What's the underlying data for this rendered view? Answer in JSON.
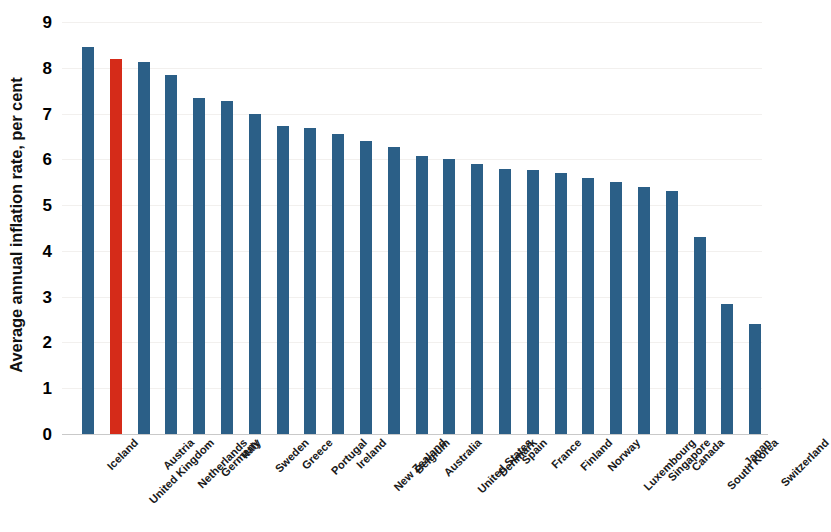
{
  "chart_data": {
    "type": "bar",
    "title": "",
    "xlabel": "",
    "ylabel": "Average annual inflation rate, per cent",
    "ylim": [
      0,
      9
    ],
    "ytick_labels": [
      "9",
      "8",
      "7",
      "6",
      "5",
      "4",
      "3",
      "2",
      "1",
      "0"
    ],
    "ytick_values": [
      9,
      8,
      7,
      6,
      5,
      4,
      3,
      2,
      1,
      0
    ],
    "grid": true,
    "legend": "none",
    "highlight_category": "United Kingdom",
    "colors": {
      "bar": "#2b5f87",
      "highlight": "#d52b19",
      "gridline": "#f2f0ee",
      "text": "#111111"
    },
    "categories": [
      "Iceland",
      "United Kingdom",
      "Austria",
      "Netherlands",
      "Germany",
      "Italy",
      "Sweden",
      "Greece",
      "Portugal",
      "Ireland",
      "New Zealand",
      "Belgium",
      "Australia",
      "United States",
      "Denmark",
      "Spain",
      "France",
      "Finland",
      "Norway",
      "Luxembourg",
      "Singapore",
      "Canada",
      "South Korea",
      "Japan",
      "Switzerland"
    ],
    "values": [
      8.45,
      8.2,
      8.12,
      7.85,
      7.35,
      7.28,
      6.98,
      6.72,
      6.68,
      6.56,
      6.4,
      6.27,
      6.07,
      6.0,
      5.9,
      5.8,
      5.76,
      5.7,
      5.6,
      5.5,
      5.4,
      5.3,
      4.3,
      2.85,
      2.4
    ]
  }
}
